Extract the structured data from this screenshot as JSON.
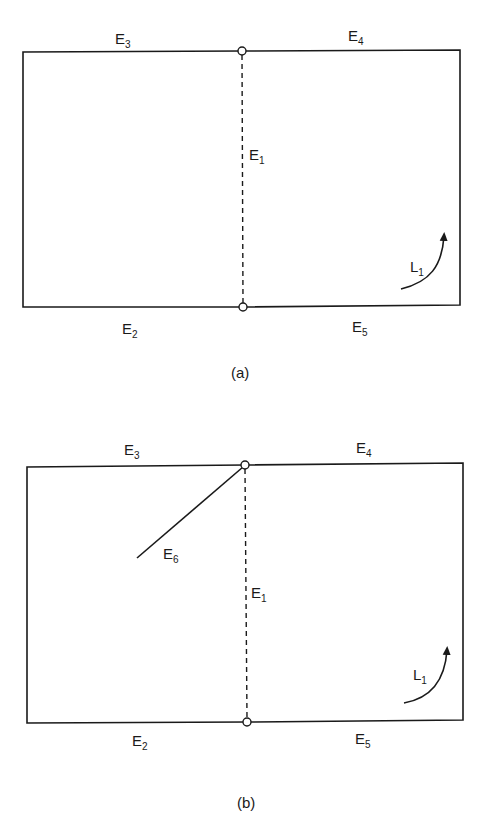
{
  "figure_a": {
    "caption": "(a)",
    "edges": {
      "E1": {
        "main": "E",
        "sub": "1"
      },
      "E2": {
        "main": "E",
        "sub": "2"
      },
      "E3": {
        "main": "E",
        "sub": "3"
      },
      "E4": {
        "main": "E",
        "sub": "4"
      },
      "E5": {
        "main": "E",
        "sub": "5"
      }
    },
    "loop": {
      "main": "L",
      "sub": "1"
    }
  },
  "figure_b": {
    "caption": "(b)",
    "edges": {
      "E1": {
        "main": "E",
        "sub": "1"
      },
      "E2": {
        "main": "E",
        "sub": "2"
      },
      "E3": {
        "main": "E",
        "sub": "3"
      },
      "E4": {
        "main": "E",
        "sub": "4"
      },
      "E5": {
        "main": "E",
        "sub": "5"
      },
      "E6": {
        "main": "E",
        "sub": "6"
      }
    },
    "loop": {
      "main": "L",
      "sub": "1"
    }
  },
  "colors": {
    "stroke": "#1a1a1a",
    "background": "#ffffff"
  }
}
